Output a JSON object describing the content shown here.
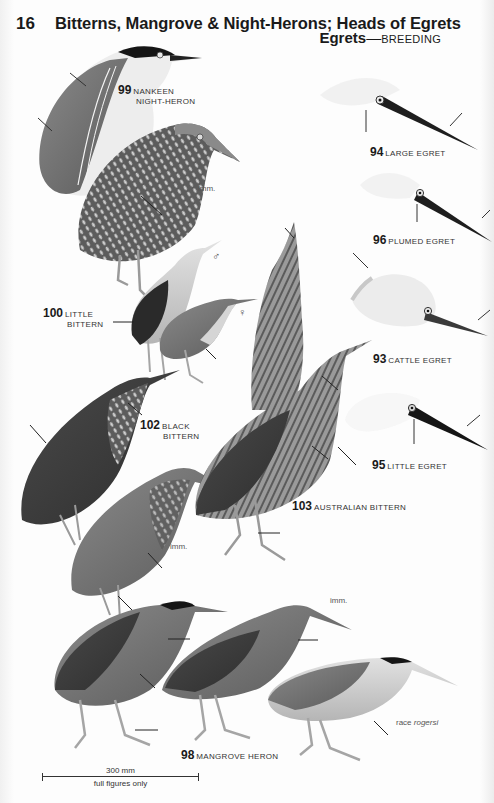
{
  "header": {
    "plate_number": "16",
    "title": "Bitterns, Mangrove & Night-Herons; Heads of Egrets",
    "subtitle_bold": "Egrets",
    "subtitle_dash": "—",
    "subtitle_caps": "BREEDING"
  },
  "species": [
    {
      "id": "99",
      "name_line1": "NANKEEN",
      "name_line2": "NIGHT-HERON"
    },
    {
      "id": "94",
      "name_line1": "LARGE EGRET"
    },
    {
      "id": "96",
      "name_line1": "PLUMED EGRET"
    },
    {
      "id": "100",
      "name_line1": "LITTLE",
      "name_line2": "BITTERN"
    },
    {
      "id": "93",
      "name_line1": "CATTLE EGRET"
    },
    {
      "id": "102",
      "name_line1": "BLACK",
      "name_line2": "BITTERN"
    },
    {
      "id": "95",
      "name_line1": "LITTLE EGRET"
    },
    {
      "id": "103",
      "name_line1": "AUSTRALIAN BITTERN"
    },
    {
      "id": "98",
      "name_line1": "MANGROVE HERON"
    }
  ],
  "notes": {
    "imm": "imm.",
    "male": "♂",
    "female": "♀",
    "race_prefix": "race ",
    "race_name": "rogersi"
  },
  "scale": {
    "length": "300 mm",
    "caption": "full figures only"
  },
  "colors": {
    "ink": "#1a1a1a",
    "paper": "#fdfdfd",
    "dark_plumage": "#3b3b3b",
    "mid_plumage": "#7a7a7a",
    "light_plumage": "#cfcfcf"
  }
}
